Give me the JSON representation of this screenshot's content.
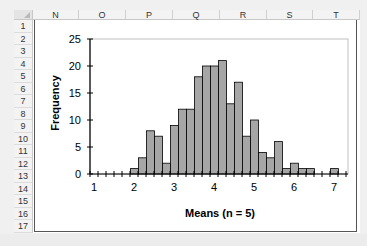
{
  "spreadsheet": {
    "columns": [
      {
        "label": "N",
        "left": 0,
        "width": 46
      },
      {
        "label": "O",
        "left": 46,
        "width": 47
      },
      {
        "label": "P",
        "left": 93,
        "width": 47
      },
      {
        "label": "Q",
        "left": 140,
        "width": 47
      },
      {
        "label": "R",
        "left": 187,
        "width": 47
      },
      {
        "label": "S",
        "left": 234,
        "width": 46
      },
      {
        "label": "T",
        "left": 280,
        "width": 47
      }
    ],
    "rows": [
      "1",
      "2",
      "3",
      "4",
      "5",
      "6",
      "7",
      "8",
      "9",
      "10",
      "11",
      "12",
      "13",
      "14",
      "15",
      "16",
      "17"
    ]
  },
  "chart_data": {
    "type": "bar",
    "title": "",
    "xlabel": "Means (n = 5)",
    "ylabel": "Frequency",
    "ylim": [
      0,
      25
    ],
    "yticks": [
      0,
      5,
      10,
      15,
      20,
      25
    ],
    "xtick_labels": [
      "1",
      "2",
      "3",
      "4",
      "5",
      "6",
      "7"
    ],
    "grid": false,
    "legend": "none",
    "bar_color": "#a6a6a6",
    "categories": [
      "1.0",
      "1.2",
      "1.4",
      "1.6",
      "1.8",
      "2.0",
      "2.2",
      "2.4",
      "2.6",
      "2.8",
      "3.0",
      "3.2",
      "3.4",
      "3.6",
      "3.8",
      "4.0",
      "4.2",
      "4.4",
      "4.6",
      "4.8",
      "5.0",
      "5.2",
      "5.4",
      "5.6",
      "5.8",
      "6.0",
      "6.2",
      "6.4",
      "6.6",
      "6.8",
      "7.0",
      "7.2"
    ],
    "values": [
      0,
      0,
      0,
      0,
      0,
      1,
      3,
      8,
      7,
      2,
      9,
      12,
      12,
      18,
      20,
      20,
      21,
      13,
      17,
      7,
      10,
      4,
      3,
      6,
      1,
      2,
      1,
      1,
      0,
      0,
      1,
      0
    ]
  }
}
